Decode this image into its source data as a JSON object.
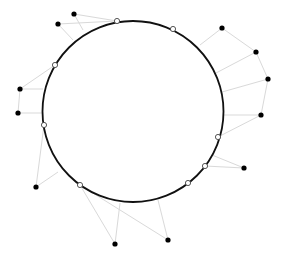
{
  "canvas": {
    "width": 284,
    "height": 259,
    "background": "#ffffff"
  },
  "circle": {
    "cx": 133,
    "cy": 111.5,
    "r": 90.5,
    "stroke": "#111111",
    "stroke_width": 1.8
  },
  "colors": {
    "external_point": "#000000",
    "circle_point_fill": "#ffffff",
    "circle_point_stroke": "#444444",
    "connector": "#d9d9d9"
  },
  "external_points": [
    {
      "x": 74,
      "y": 14
    },
    {
      "x": 58,
      "y": 24
    },
    {
      "x": 222,
      "y": 28
    },
    {
      "x": 256,
      "y": 52
    },
    {
      "x": 268,
      "y": 79
    },
    {
      "x": 261,
      "y": 115
    },
    {
      "x": 20,
      "y": 89
    },
    {
      "x": 18,
      "y": 113
    },
    {
      "x": 36,
      "y": 187
    },
    {
      "x": 115,
      "y": 244
    },
    {
      "x": 168,
      "y": 240
    },
    {
      "x": 244,
      "y": 168
    }
  ],
  "circle_points": [
    {
      "x": 117,
      "y": 21
    },
    {
      "x": 173,
      "y": 29
    },
    {
      "x": 55,
      "y": 65
    },
    {
      "x": 44,
      "y": 125
    },
    {
      "x": 218,
      "y": 137
    },
    {
      "x": 205,
      "y": 166
    },
    {
      "x": 188,
      "y": 183
    },
    {
      "x": 80,
      "y": 185
    }
  ],
  "connectors": [
    [
      74,
      14,
      117,
      21
    ],
    [
      58,
      24,
      117,
      21
    ],
    [
      74,
      14,
      83,
      30
    ],
    [
      58,
      24,
      73,
      40
    ],
    [
      20,
      89,
      55,
      65
    ],
    [
      20,
      89,
      43,
      89
    ],
    [
      18,
      113,
      43,
      113
    ],
    [
      20,
      89,
      18,
      113
    ],
    [
      36,
      187,
      44,
      125
    ],
    [
      36,
      187,
      58,
      172
    ],
    [
      115,
      244,
      80,
      185
    ],
    [
      115,
      244,
      120,
      203
    ],
    [
      168,
      240,
      80,
      185
    ],
    [
      168,
      240,
      158,
      200
    ],
    [
      244,
      168,
      205,
      166
    ],
    [
      244,
      168,
      212,
      155
    ],
    [
      261,
      115,
      218,
      137
    ],
    [
      261,
      115,
      223,
      115
    ],
    [
      261,
      115,
      268,
      79
    ],
    [
      268,
      79,
      222,
      92
    ],
    [
      268,
      79,
      256,
      52
    ],
    [
      256,
      52,
      216,
      73
    ],
    [
      256,
      52,
      222,
      28
    ],
    [
      222,
      28,
      200,
      45
    ]
  ]
}
